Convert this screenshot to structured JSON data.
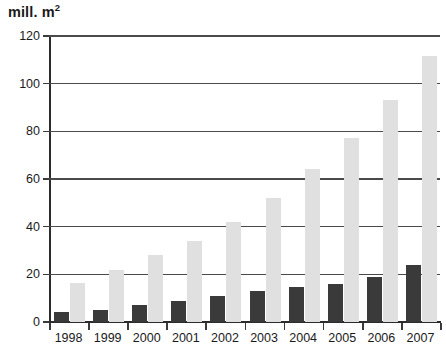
{
  "chart_data": {
    "type": "bar",
    "title_main": "mill. m",
    "title_sup": "2",
    "xlabel": "",
    "ylabel": "mill. m²",
    "ylim": [
      0,
      120
    ],
    "yticks": [
      0,
      20,
      40,
      60,
      80,
      100,
      120
    ],
    "ytick_labels": [
      "0",
      "20",
      "40",
      "60",
      "80",
      "100",
      "120"
    ],
    "grid": true,
    "grid_axis": "y",
    "legend": null,
    "categories": [
      "1998",
      "1999",
      "2000",
      "2001",
      "2002",
      "2003",
      "2004",
      "2005",
      "2006",
      "2007"
    ],
    "series": [
      {
        "name": "dark",
        "color": "#3a3a3a",
        "values": [
          4,
          5,
          7,
          9,
          11,
          13,
          14.5,
          16,
          19,
          24
        ]
      },
      {
        "name": "light",
        "color": "#e0e0e0",
        "values": [
          16.5,
          22,
          28,
          34,
          42,
          52,
          64,
          77,
          93,
          111.5
        ]
      }
    ]
  },
  "axes": {
    "y_title": "mill. m²"
  }
}
